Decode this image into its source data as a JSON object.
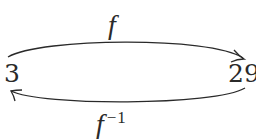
{
  "diagram": {
    "nodes": [
      {
        "id": "left",
        "label": "3"
      },
      {
        "id": "right",
        "label": "29"
      }
    ],
    "edges": [
      {
        "from": "3",
        "to": "29",
        "label": "f",
        "position": "top"
      },
      {
        "from": "29",
        "to": "3",
        "label": "f",
        "superscript": "−1",
        "position": "bottom"
      }
    ],
    "colors": {
      "stroke": "#2a2a2a",
      "background": "#ffffff"
    }
  }
}
